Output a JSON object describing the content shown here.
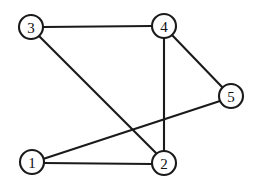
{
  "figure": {
    "type": "undirected-graph-diagram",
    "width": 257,
    "height": 184,
    "background_color": "#ffffff",
    "stroke_color": "#1a1a1a",
    "node_fill_color": "#ffffff",
    "node_radius": 12,
    "edge_width": 2.1
  },
  "nodes": [
    {
      "id": "1",
      "label": "1",
      "x": 32,
      "y": 162
    },
    {
      "id": "2",
      "label": "2",
      "x": 164,
      "y": 163
    },
    {
      "id": "3",
      "label": "3",
      "x": 31,
      "y": 27
    },
    {
      "id": "4",
      "label": "4",
      "x": 164,
      "y": 26
    },
    {
      "id": "5",
      "label": "5",
      "x": 231,
      "y": 96
    }
  ],
  "edges": [
    {
      "id": "edge-3-4",
      "source": "3",
      "target": "4",
      "x1": 43,
      "y1": 27,
      "x2": 152,
      "y2": 26
    },
    {
      "id": "edge-3-2",
      "source": "3",
      "target": "2",
      "x1": 39,
      "y1": 36,
      "x2": 156,
      "y2": 153
    },
    {
      "id": "edge-4-5",
      "source": "4",
      "target": "5",
      "x1": 172,
      "y1": 35,
      "x2": 223,
      "y2": 88
    },
    {
      "id": "edge-4-2",
      "source": "4",
      "target": "2",
      "x1": 164,
      "y1": 38,
      "x2": 164,
      "y2": 151
    },
    {
      "id": "edge-1-2",
      "source": "1",
      "target": "2",
      "x1": 44,
      "y1": 163,
      "x2": 152,
      "y2": 164
    },
    {
      "id": "edge-1-5",
      "source": "1",
      "target": "5",
      "x1": 43,
      "y1": 159,
      "x2": 220,
      "y2": 101
    }
  ],
  "chart_data": {
    "type": "diagram",
    "title": "",
    "node_labels": [
      "1",
      "2",
      "3",
      "4",
      "5"
    ],
    "edge_list": [
      [
        "3",
        "4"
      ],
      [
        "3",
        "2"
      ],
      [
        "4",
        "5"
      ],
      [
        "4",
        "2"
      ],
      [
        "1",
        "2"
      ],
      [
        "1",
        "5"
      ]
    ],
    "node_count": 5,
    "edge_count": 6,
    "degrees": {
      "1": 2,
      "2": 3,
      "3": 2,
      "4": 3,
      "5": 2
    },
    "crossings": [
      [
        "3-2",
        "1-5"
      ],
      [
        "4-2",
        "1-5"
      ]
    ]
  }
}
